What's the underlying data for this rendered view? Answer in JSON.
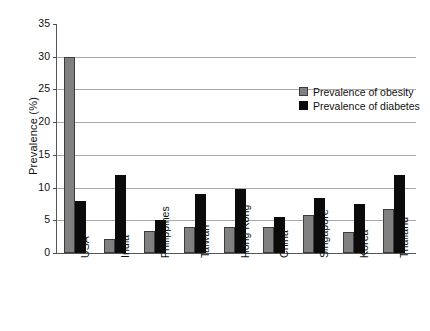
{
  "chart_data": {
    "type": "bar",
    "title": "",
    "xlabel": "",
    "ylabel": "Prevalence (%)",
    "ylim": [
      0,
      35
    ],
    "ytick_step": 5,
    "yticks": [
      0,
      5,
      10,
      15,
      20,
      25,
      30,
      35
    ],
    "ytick_labels": [
      "0",
      "5",
      "10",
      "15",
      "20",
      "25",
      "30",
      "35"
    ],
    "grid": true,
    "grid_axis": "y",
    "legend_position": "upper-right-inside",
    "categories": [
      "USA",
      "India",
      "Philippines",
      "Taiwan",
      "Hong Kong",
      "China",
      "Singapore",
      "Korea",
      "Thailand"
    ],
    "series": [
      {
        "name": "Prevalence of obesity",
        "color": "#808080",
        "values": [
          30.0,
          2.2,
          3.3,
          4.0,
          3.9,
          4.0,
          5.8,
          3.2,
          6.7
        ]
      },
      {
        "name": "Prevalence of diabetes",
        "color": "#0b0b0b",
        "values": [
          8.0,
          12.0,
          5.0,
          9.0,
          9.8,
          5.5,
          8.4,
          7.5,
          12.0
        ]
      }
    ]
  },
  "legend": {
    "items": [
      {
        "label": "Prevalence of obesity",
        "swatch": "obesity"
      },
      {
        "label": "Prevalence of diabetes",
        "swatch": "diabetes"
      }
    ]
  }
}
